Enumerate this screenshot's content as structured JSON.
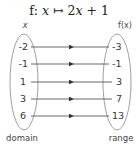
{
  "title": "f: x ↦ 2x + 1",
  "title_parts": {
    "f": "f:",
    "x1": "x",
    "arrow": "↦",
    "rhs_num": "2",
    "x2": "x",
    "rest": " + 1"
  },
  "domain_header": "x",
  "range_header": "f(x)",
  "domain_label": "domain",
  "range_label": "range",
  "mapping": [
    {
      "input": "-2",
      "output": "-3"
    },
    {
      "input": "-1",
      "output": "-1"
    },
    {
      "input": "1",
      "output": "3"
    },
    {
      "input": "3",
      "output": "7"
    },
    {
      "input": "6",
      "output": "13"
    }
  ],
  "colors": {
    "ellipse": "#999999",
    "arrow": "#333333",
    "text": "#333333"
  }
}
